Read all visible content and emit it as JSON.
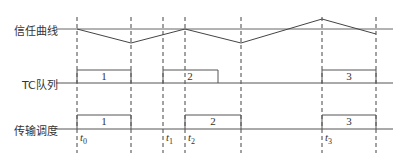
{
  "rows": {
    "trust_curve": {
      "label": "信任曲线"
    },
    "tc_queue": {
      "label": "TC队列"
    },
    "transmission_schedule": {
      "label": "传输调度"
    }
  },
  "time_markers": [
    {
      "name": "t",
      "sub": "0",
      "x": 77
    },
    {
      "name": "t",
      "sub": "1",
      "x": 163
    },
    {
      "name": "t",
      "sub": "2",
      "x": 185
    },
    {
      "name": "t",
      "sub": "3",
      "x": 322
    }
  ],
  "dashed_lines_x": [
    77,
    131,
    163,
    185,
    241,
    322,
    376
  ],
  "trust_curve_points": [
    [
      77,
      29
    ],
    [
      131,
      43
    ],
    [
      185,
      29
    ],
    [
      241,
      43
    ],
    [
      322,
      19
    ],
    [
      376,
      34
    ]
  ],
  "tc_queue_pulses": [
    {
      "label": "1",
      "x1": 77,
      "x2": 131
    },
    {
      "label": "2",
      "x1": 163,
      "x2": 218
    },
    {
      "label": "3",
      "x1": 322,
      "x2": 376
    }
  ],
  "transmission_pulses": [
    {
      "label": "1",
      "x1": 77,
      "x2": 131
    },
    {
      "label": "2",
      "x1": 185,
      "x2": 241
    },
    {
      "label": "3",
      "x1": 322,
      "x2": 376
    }
  ],
  "colors": {
    "line": "#555555",
    "dash": "#444444",
    "text": "#333333"
  }
}
